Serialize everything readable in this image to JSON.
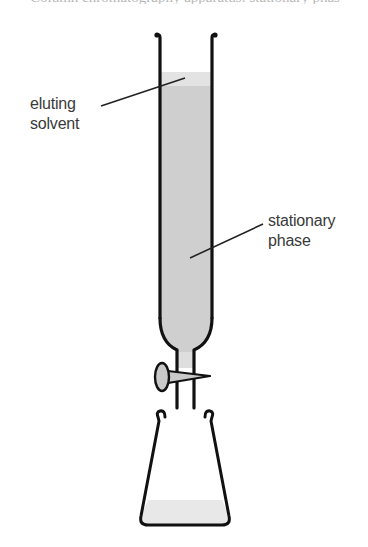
{
  "caption_fragment": "Column chromatography apparatus: stationary phase",
  "labels": {
    "eluting_solvent": {
      "line1": "eluting",
      "line2": "solvent"
    },
    "stationary_phase": {
      "line1": "stationary",
      "line2": "phase"
    }
  },
  "colors": {
    "outline": "#111111",
    "stationary_fill": "#cfcfcf",
    "solvent_fill": "#e6e6e6",
    "flask_liquid": "#e8e8e8",
    "label_text": "#3a3a3a"
  },
  "components": [
    "chromatography-column",
    "stopcock",
    "conical-flask",
    "eluting-solvent",
    "stationary-phase"
  ]
}
